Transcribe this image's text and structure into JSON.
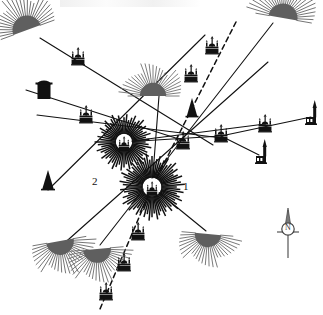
{
  "figure": {
    "type": "archaeological-site-alignment-map",
    "background_color": "#ffffff",
    "ink_color": "#111111",
    "width": 323,
    "height": 315
  },
  "labels": [
    {
      "id": "label-1",
      "text": "1",
      "x": 183,
      "y": 181
    },
    {
      "id": "label-2",
      "text": "2",
      "x": 92,
      "y": 176
    }
  ],
  "compass": {
    "name": "north-arrow",
    "x": 288,
    "y": 232,
    "letter": "N"
  },
  "focus_sunbursts": [
    {
      "name": "radiating-centre-1",
      "x": 152,
      "y": 187,
      "radius": 31,
      "rays": 72,
      "label": "1"
    },
    {
      "name": "radiating-centre-2",
      "x": 124,
      "y": 142,
      "radius": 27,
      "rays": 60,
      "label": "2"
    }
  ],
  "half_suns": [
    {
      "name": "half-sun-nw",
      "x": 27,
      "y": 30,
      "size": 22,
      "rotation": -20
    },
    {
      "name": "half-sun-ne",
      "x": 283,
      "y": 18,
      "size": 22,
      "rotation": 10
    },
    {
      "name": "half-sun-centre",
      "x": 153,
      "y": 96,
      "size": 20,
      "rotation": 0
    },
    {
      "name": "half-sun-sw-left",
      "x": 60,
      "y": 241,
      "size": 21,
      "rotation": 170
    },
    {
      "name": "half-sun-sw-right",
      "x": 97,
      "y": 249,
      "size": 21,
      "rotation": 175
    },
    {
      "name": "half-sun-se",
      "x": 208,
      "y": 234,
      "size": 20,
      "rotation": 185
    }
  ],
  "crescents": [
    {
      "name": "crescent-moon-nw",
      "x": 16,
      "y": 85,
      "size": 16,
      "rotation": 20
    },
    {
      "name": "crescent-moon-ne",
      "x": 237,
      "y": 17,
      "size": 15,
      "rotation": 200
    }
  ],
  "cones": [
    {
      "name": "dark-cone-left",
      "x": 48,
      "y": 190,
      "w": 12,
      "h": 20
    },
    {
      "name": "dark-cone-centre",
      "x": 192,
      "y": 117,
      "w": 11,
      "h": 19
    }
  ],
  "drums": [
    {
      "name": "dark-drum-left",
      "x": 44,
      "y": 99,
      "w": 13,
      "h": 15
    }
  ],
  "mosques": [
    {
      "name": "mosque-site",
      "x": 78,
      "y": 59
    },
    {
      "name": "mosque-site",
      "x": 212,
      "y": 48
    },
    {
      "name": "mosque-site",
      "x": 191,
      "y": 76
    },
    {
      "name": "mosque-site",
      "x": 86,
      "y": 117
    },
    {
      "name": "mosque-site",
      "x": 183,
      "y": 143
    },
    {
      "name": "mosque-site",
      "x": 221,
      "y": 136
    },
    {
      "name": "mosque-site",
      "x": 265,
      "y": 126
    },
    {
      "name": "mosque-site",
      "x": 138,
      "y": 234
    },
    {
      "name": "mosque-site",
      "x": 124,
      "y": 265
    },
    {
      "name": "mosque-site",
      "x": 106,
      "y": 294
    }
  ],
  "churches": [
    {
      "name": "church-tower-site",
      "x": 261,
      "y": 156
    },
    {
      "name": "church-tower-site",
      "x": 311,
      "y": 117
    }
  ],
  "sight_lines": [
    {
      "name": "sight-line",
      "x1": 40,
      "y1": 38,
      "x2": 213,
      "y2": 145,
      "style": "solid"
    },
    {
      "name": "sight-line",
      "x1": 26,
      "y1": 90,
      "x2": 185,
      "y2": 141,
      "style": "solid"
    },
    {
      "name": "sight-line",
      "x1": 273,
      "y1": 23,
      "x2": 100,
      "y2": 245,
      "style": "solid"
    },
    {
      "name": "sight-line",
      "x1": 268,
      "y1": 62,
      "x2": 60,
      "y2": 247,
      "style": "solid"
    },
    {
      "name": "sight-line",
      "x1": 37,
      "y1": 115,
      "x2": 222,
      "y2": 138,
      "style": "solid"
    },
    {
      "name": "sight-line",
      "x1": 48,
      "y1": 190,
      "x2": 205,
      "y2": 35,
      "style": "solid"
    },
    {
      "name": "sight-line",
      "x1": 152,
      "y1": 187,
      "x2": 206,
      "y2": 231,
      "style": "solid"
    },
    {
      "name": "sight-line",
      "x1": 152,
      "y1": 187,
      "x2": 159,
      "y2": 96,
      "style": "solid"
    },
    {
      "name": "sight-line",
      "x1": 124,
      "y1": 142,
      "x2": 265,
      "y2": 124,
      "style": "solid"
    },
    {
      "name": "sight-line",
      "x1": 221,
      "y1": 136,
      "x2": 311,
      "y2": 117,
      "style": "solid"
    },
    {
      "name": "sight-line",
      "x1": 221,
      "y1": 136,
      "x2": 259,
      "y2": 155,
      "style": "solid"
    },
    {
      "name": "sight-line",
      "x1": 124,
      "y1": 142,
      "x2": 221,
      "y2": 136,
      "style": "solid"
    },
    {
      "name": "dashed-alignment",
      "x1": 236,
      "y1": 22,
      "x2": 152,
      "y2": 187,
      "style": "dashed"
    },
    {
      "name": "dashed-alignment",
      "x1": 152,
      "y1": 187,
      "x2": 100,
      "y2": 309,
      "style": "dashed"
    }
  ],
  "legend_note": ""
}
